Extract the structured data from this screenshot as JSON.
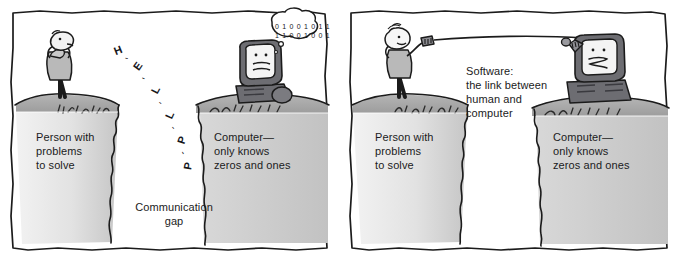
{
  "illustration": {
    "title": "Communication gap versus software as the link",
    "panels": [
      {
        "id": "panel-1",
        "captions": {
          "person": "Person with\nproblems\nto solve",
          "computer": "Computer—\nonly knows\nzeros and ones",
          "gap": "Communication\ngap"
        },
        "speech_letters": [
          "H",
          "E",
          "L",
          "L",
          "P"
        ],
        "letter_separator": "-",
        "thought_bubble_bits": "0 1 0 0 1 0 1 1\n1 1 0 0 1 0 0 1"
      },
      {
        "id": "panel-2",
        "captions": {
          "person": "Person with\nproblems\nto solve",
          "computer": "Computer—\nonly knows\nzeros and ones",
          "software": "Software:\nthe link between\nhuman and\ncomputer"
        }
      }
    ]
  },
  "colors": {
    "ink": "#17171c",
    "cliff_top": "#a9a9a9",
    "cliff_face_light": "#efefef",
    "cliff_face_dark": "#c9c9c9",
    "monitor_dark": "#6d6d72",
    "monitor_screen": "#f4f4f4",
    "figure_gray": "#b9b9b9",
    "background": "#ffffff"
  }
}
